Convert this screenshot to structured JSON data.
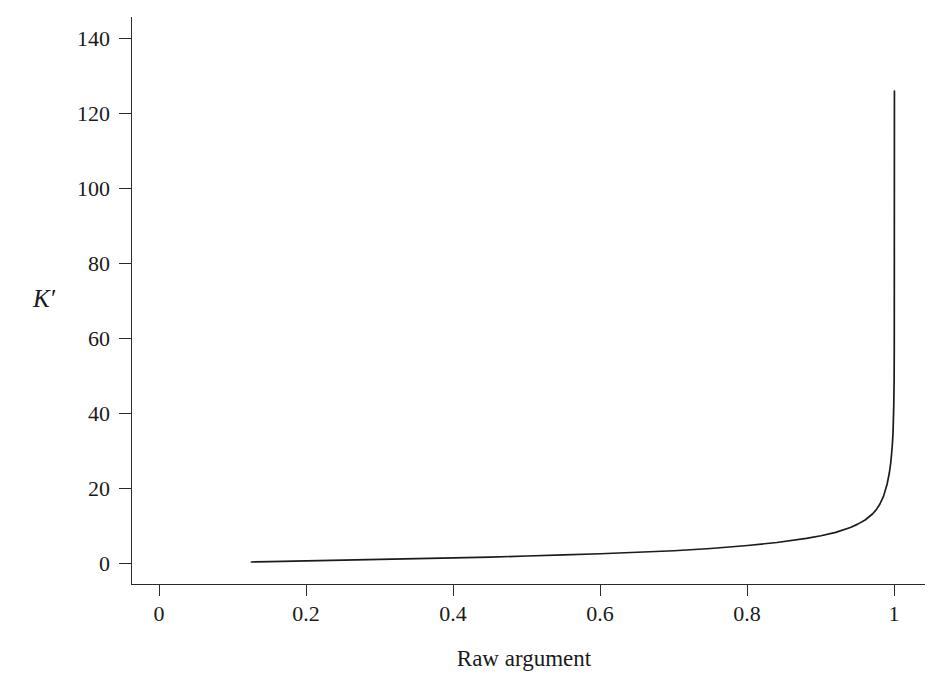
{
  "figure": {
    "background_color": "#ffffff",
    "curve_color": "#1b1b1b",
    "axis_color": "#2b2b2b"
  },
  "axes": {
    "xlabel": "Raw argument",
    "ylabel": "K′",
    "x_ticks": [
      "0",
      "0.2",
      "0.4",
      "0.6",
      "0.8",
      "1"
    ],
    "y_ticks": [
      "0",
      "20",
      "40",
      "60",
      "80",
      "100",
      "120",
      "140"
    ]
  },
  "chart_data": {
    "type": "line",
    "title": "",
    "xlabel": "Raw argument",
    "ylabel": "K′",
    "xlim": [
      0,
      1.08
    ],
    "ylim": [
      0,
      148
    ],
    "xticks": [
      0,
      0.2,
      0.4,
      0.6,
      0.8,
      1
    ],
    "xticklabels": [
      "0",
      "0.2",
      "0.4",
      "0.6",
      "0.8",
      "1"
    ],
    "yticks": [
      0,
      20,
      40,
      60,
      80,
      100,
      120,
      140
    ],
    "yticklabels": [
      "0",
      "20",
      "40",
      "60",
      "80",
      "100",
      "120",
      "140"
    ],
    "grid": false,
    "legend": false,
    "series": [
      {
        "name": "K'",
        "x": [
          0.125,
          0.15,
          0.2,
          0.25,
          0.3,
          0.35,
          0.4,
          0.45,
          0.5,
          0.55,
          0.6,
          0.65,
          0.7,
          0.75,
          0.8,
          0.84,
          0.88,
          0.9,
          0.92,
          0.94,
          0.95,
          0.96,
          0.97,
          0.975,
          0.98,
          0.985,
          0.99,
          0.993,
          0.995,
          0.997,
          0.998,
          0.999,
          0.9995,
          0.9997,
          0.9999
        ],
        "y": [
          0.4,
          0.5,
          0.7,
          0.9,
          1.1,
          1.3,
          1.5,
          1.7,
          2.0,
          2.3,
          2.6,
          3.0,
          3.4,
          4.0,
          4.8,
          5.6,
          6.7,
          7.4,
          8.3,
          9.6,
          10.5,
          11.6,
          13.2,
          14.3,
          15.8,
          17.9,
          21.2,
          24.2,
          27.0,
          31.4,
          34.9,
          42.0,
          49.0,
          58.0,
          126.0
        ]
      }
    ]
  }
}
